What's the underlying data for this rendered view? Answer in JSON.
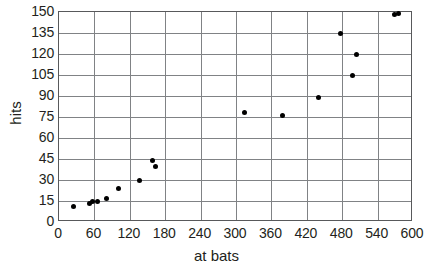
{
  "chart_data": {
    "type": "scatter",
    "title": "",
    "xlabel": "at bats",
    "ylabel": "hits",
    "xlim": [
      0,
      600
    ],
    "ylim": [
      0,
      150
    ],
    "xticks": [
      0,
      60,
      120,
      180,
      240,
      300,
      360,
      420,
      480,
      540,
      600
    ],
    "yticks": [
      0,
      15,
      30,
      45,
      60,
      75,
      90,
      105,
      120,
      135,
      150
    ],
    "grid": true,
    "legend": null,
    "marker_color": "#000000",
    "grid_color": "#808285",
    "frame_color": "#58595b",
    "points": [
      {
        "x": 25,
        "y": 11
      },
      {
        "x": 51,
        "y": 13
      },
      {
        "x": 57,
        "y": 15
      },
      {
        "x": 66,
        "y": 15
      },
      {
        "x": 80,
        "y": 17
      },
      {
        "x": 101,
        "y": 24
      },
      {
        "x": 137,
        "y": 30
      },
      {
        "x": 159,
        "y": 44
      },
      {
        "x": 163,
        "y": 40
      },
      {
        "x": 315,
        "y": 78
      },
      {
        "x": 378,
        "y": 76
      },
      {
        "x": 440,
        "y": 89
      },
      {
        "x": 498,
        "y": 105
      },
      {
        "x": 505,
        "y": 120
      },
      {
        "x": 477,
        "y": 135
      },
      {
        "x": 568,
        "y": 148
      },
      {
        "x": 575,
        "y": 149
      }
    ]
  },
  "axes": {
    "x_title": "at bats",
    "y_title": "hits",
    "x_tick_labels": [
      "0",
      "60",
      "120",
      "180",
      "240",
      "300",
      "360",
      "420",
      "480",
      "540",
      "600"
    ],
    "y_tick_labels": [
      "0",
      "15",
      "30",
      "45",
      "60",
      "75",
      "90",
      "105",
      "120",
      "135",
      "150"
    ]
  }
}
